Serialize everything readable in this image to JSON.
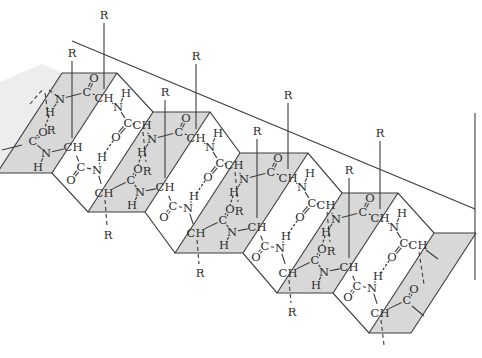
{
  "colors": {
    "background": "#ffffff",
    "ink": "#3c3c3c",
    "face_fill": "#d8d8d8",
    "label": "#2b2b2b"
  },
  "canvas": {
    "width": 482,
    "height": 358
  },
  "sheet": {
    "faces": [
      [
        [
          62,
          73
        ],
        [
          117,
          73
        ],
        [
          52,
          173
        ],
        [
          -3,
          173
        ]
      ],
      [
        [
          153,
          112
        ],
        [
          210,
          112
        ],
        [
          145,
          212
        ],
        [
          88,
          212
        ]
      ],
      [
        [
          240,
          153
        ],
        [
          308,
          153
        ],
        [
          243,
          253
        ],
        [
          175,
          253
        ]
      ],
      [
        [
          342,
          193
        ],
        [
          398,
          193
        ],
        [
          333,
          293
        ],
        [
          277,
          293
        ]
      ],
      [
        [
          434,
          233
        ],
        [
          476,
          233
        ],
        [
          411,
          333
        ],
        [
          369,
          333
        ]
      ]
    ],
    "faded_face": [
      [
        62,
        73
      ],
      [
        -3,
        173
      ],
      [
        -14,
        155
      ],
      [
        -14,
        88
      ],
      [
        42,
        64
      ]
    ],
    "top_zigzag": [
      [
        62,
        73
      ],
      [
        117,
        73
      ],
      [
        153,
        112
      ],
      [
        210,
        112
      ],
      [
        240,
        153
      ],
      [
        308,
        153
      ],
      [
        342,
        193
      ],
      [
        398,
        193
      ],
      [
        434,
        233
      ],
      [
        476,
        233
      ]
    ],
    "bottom_zigzag": [
      [
        -3,
        173
      ],
      [
        52,
        173
      ],
      [
        88,
        212
      ],
      [
        145,
        212
      ],
      [
        175,
        253
      ],
      [
        243,
        253
      ],
      [
        277,
        293
      ],
      [
        333,
        293
      ],
      [
        369,
        333
      ],
      [
        411,
        333
      ]
    ],
    "fold_lines": [
      [
        62,
        73,
        -3,
        173
      ],
      [
        117,
        73,
        52,
        173
      ],
      [
        153,
        112,
        88,
        212
      ],
      [
        210,
        112,
        145,
        212
      ],
      [
        240,
        153,
        175,
        253
      ],
      [
        308,
        153,
        243,
        253
      ],
      [
        342,
        193,
        277,
        293
      ],
      [
        398,
        193,
        333,
        293
      ],
      [
        434,
        233,
        369,
        333
      ],
      [
        476,
        233,
        411,
        333
      ]
    ],
    "long_lines": [
      [
        72,
        41,
        475,
        209
      ],
      [
        475,
        113,
        475,
        280
      ]
    ]
  },
  "atoms": [
    {
      "id": "bN0a",
      "t": "N",
      "x": 60,
      "y": 99
    },
    {
      "id": "bH0a",
      "t": "H",
      "x": 50,
      "y": 112
    },
    {
      "id": "bC0a",
      "t": "C",
      "x": 87,
      "y": 92
    },
    {
      "id": "bO0a",
      "t": "O",
      "x": 94,
      "y": 78
    },
    {
      "id": "bCH0a",
      "t": "CH",
      "x": 104,
      "y": 98
    },
    {
      "id": "bN0b",
      "t": "N",
      "x": 118,
      "y": 107
    },
    {
      "id": "bH0b",
      "t": "H",
      "x": 126,
      "y": 93
    },
    {
      "id": "bC0b",
      "t": "C",
      "x": 128,
      "y": 123
    },
    {
      "id": "bO0b",
      "t": "O",
      "x": 116,
      "y": 137
    },
    {
      "id": "bCH0b",
      "t": "CH",
      "x": 142,
      "y": 125
    },
    {
      "id": "bN1a",
      "t": "N",
      "x": 152,
      "y": 139
    },
    {
      "id": "bH1a",
      "t": "H",
      "x": 142,
      "y": 152
    },
    {
      "id": "bC1a",
      "t": "C",
      "x": 179,
      "y": 132
    },
    {
      "id": "bO1a",
      "t": "O",
      "x": 186,
      "y": 118
    },
    {
      "id": "bCH1a",
      "t": "CH",
      "x": 196,
      "y": 138
    },
    {
      "id": "bN1b",
      "t": "N",
      "x": 210,
      "y": 147
    },
    {
      "id": "bH1b",
      "t": "H",
      "x": 218,
      "y": 133
    },
    {
      "id": "bC1b",
      "t": "C",
      "x": 220,
      "y": 163
    },
    {
      "id": "bO1b",
      "t": "O",
      "x": 208,
      "y": 177
    },
    {
      "id": "bCH1b",
      "t": "CH",
      "x": 234,
      "y": 165
    },
    {
      "id": "bN2a",
      "t": "N",
      "x": 244,
      "y": 179
    },
    {
      "id": "bH2a",
      "t": "H",
      "x": 234,
      "y": 192
    },
    {
      "id": "bC2a",
      "t": "C",
      "x": 271,
      "y": 172
    },
    {
      "id": "bO2a",
      "t": "O",
      "x": 278,
      "y": 158
    },
    {
      "id": "bCH2a",
      "t": "CH",
      "x": 288,
      "y": 178
    },
    {
      "id": "bN2b",
      "t": "N",
      "x": 302,
      "y": 187
    },
    {
      "id": "bH2b",
      "t": "H",
      "x": 310,
      "y": 173
    },
    {
      "id": "bC2b",
      "t": "C",
      "x": 312,
      "y": 203
    },
    {
      "id": "bO2b",
      "t": "O",
      "x": 300,
      "y": 217
    },
    {
      "id": "bCH2b",
      "t": "CH",
      "x": 326,
      "y": 205
    },
    {
      "id": "bN3a",
      "t": "N",
      "x": 336,
      "y": 219
    },
    {
      "id": "bH3a",
      "t": "H",
      "x": 326,
      "y": 232
    },
    {
      "id": "bC3a",
      "t": "C",
      "x": 363,
      "y": 212
    },
    {
      "id": "bO3a",
      "t": "O",
      "x": 370,
      "y": 198
    },
    {
      "id": "bCH3a",
      "t": "CH",
      "x": 380,
      "y": 218
    },
    {
      "id": "bN3b",
      "t": "N",
      "x": 394,
      "y": 227
    },
    {
      "id": "bH3b",
      "t": "H",
      "x": 402,
      "y": 213
    },
    {
      "id": "bC3b",
      "t": "C",
      "x": 404,
      "y": 243
    },
    {
      "id": "bO3b",
      "t": "O",
      "x": 392,
      "y": 257
    },
    {
      "id": "bCH3b",
      "t": "CH",
      "x": 418,
      "y": 245
    },
    {
      "id": "fC0",
      "t": "C",
      "x": 33,
      "y": 141
    },
    {
      "id": "fO0",
      "t": "O",
      "x": 43,
      "y": 132
    },
    {
      "id": "fN0",
      "t": "N",
      "x": 46,
      "y": 153
    },
    {
      "id": "fH0",
      "t": "H",
      "x": 38,
      "y": 167
    },
    {
      "id": "fCH0",
      "t": "CH",
      "x": 73,
      "y": 147
    },
    {
      "id": "fC1",
      "t": "C",
      "x": 81,
      "y": 167
    },
    {
      "id": "fO1",
      "t": "O",
      "x": 71,
      "y": 180
    },
    {
      "id": "fN1",
      "t": "N",
      "x": 97,
      "y": 170
    },
    {
      "id": "fH1",
      "t": "H",
      "x": 102,
      "y": 157
    },
    {
      "id": "fCH1",
      "t": "CH",
      "x": 104,
      "y": 193
    },
    {
      "id": "fC2",
      "t": "C",
      "x": 131,
      "y": 180
    },
    {
      "id": "fO2",
      "t": "O",
      "x": 138,
      "y": 169
    },
    {
      "id": "fN2",
      "t": "N",
      "x": 140,
      "y": 192
    },
    {
      "id": "fH2",
      "t": "H",
      "x": 132,
      "y": 205
    },
    {
      "id": "fCH2",
      "t": "CH",
      "x": 165,
      "y": 187
    },
    {
      "id": "fC3",
      "t": "C",
      "x": 173,
      "y": 206
    },
    {
      "id": "fO3",
      "t": "O",
      "x": 164,
      "y": 217
    },
    {
      "id": "fN3",
      "t": "N",
      "x": 188,
      "y": 208
    },
    {
      "id": "fH3",
      "t": "H",
      "x": 194,
      "y": 196
    },
    {
      "id": "fCH3",
      "t": "CH",
      "x": 196,
      "y": 233
    },
    {
      "id": "fC4",
      "t": "C",
      "x": 223,
      "y": 220
    },
    {
      "id": "fO4",
      "t": "O",
      "x": 230,
      "y": 209
    },
    {
      "id": "fN4",
      "t": "N",
      "x": 232,
      "y": 232
    },
    {
      "id": "fH4",
      "t": "H",
      "x": 224,
      "y": 245
    },
    {
      "id": "fCH4",
      "t": "CH",
      "x": 257,
      "y": 227
    },
    {
      "id": "fC5",
      "t": "C",
      "x": 265,
      "y": 246
    },
    {
      "id": "fO5",
      "t": "O",
      "x": 256,
      "y": 257
    },
    {
      "id": "fN5",
      "t": "N",
      "x": 280,
      "y": 248
    },
    {
      "id": "fH5",
      "t": "H",
      "x": 286,
      "y": 236
    },
    {
      "id": "fCH5",
      "t": "CH",
      "x": 288,
      "y": 273
    },
    {
      "id": "fC6",
      "t": "C",
      "x": 315,
      "y": 260
    },
    {
      "id": "fO6",
      "t": "O",
      "x": 322,
      "y": 249
    },
    {
      "id": "fN6",
      "t": "N",
      "x": 324,
      "y": 272
    },
    {
      "id": "fH6",
      "t": "H",
      "x": 316,
      "y": 285
    },
    {
      "id": "fCH6",
      "t": "CH",
      "x": 349,
      "y": 267
    },
    {
      "id": "fC7",
      "t": "C",
      "x": 357,
      "y": 286
    },
    {
      "id": "fO7",
      "t": "O",
      "x": 348,
      "y": 297
    },
    {
      "id": "fN7",
      "t": "N",
      "x": 372,
      "y": 288
    },
    {
      "id": "fH7",
      "t": "H",
      "x": 378,
      "y": 276
    },
    {
      "id": "fCH7",
      "t": "CH",
      "x": 380,
      "y": 313
    },
    {
      "id": "fC8",
      "t": "C",
      "x": 407,
      "y": 300
    },
    {
      "id": "fO8",
      "t": "O",
      "x": 414,
      "y": 289
    },
    {
      "id": "lR",
      "t": "R",
      "x": 51,
      "y": 130
    }
  ],
  "bonds": [
    [
      "bN0a",
      "bC0a"
    ],
    [
      "bC0a",
      "bCH0a"
    ],
    [
      "bCH0a",
      "bN0b"
    ],
    [
      "bN0b",
      "bC0b"
    ],
    [
      "bC0b",
      "bCH0b"
    ],
    [
      "bCH0b",
      "bN1a"
    ],
    [
      "bN1a",
      "bC1a"
    ],
    [
      "bC1a",
      "bCH1a"
    ],
    [
      "bCH1a",
      "bN1b"
    ],
    [
      "bN1b",
      "bC1b"
    ],
    [
      "bC1b",
      "bCH1b"
    ],
    [
      "bCH1b",
      "bN2a"
    ],
    [
      "bN2a",
      "bC2a"
    ],
    [
      "bC2a",
      "bCH2a"
    ],
    [
      "bCH2a",
      "bN2b"
    ],
    [
      "bN2b",
      "bC2b"
    ],
    [
      "bC2b",
      "bCH2b"
    ],
    [
      "bCH2b",
      "bN3a"
    ],
    [
      "bN3a",
      "bC3a"
    ],
    [
      "bC3a",
      "bCH3a"
    ],
    [
      "bCH3a",
      "bN3b"
    ],
    [
      "bN3b",
      "bC3b"
    ],
    [
      "bC3b",
      "bCH3b"
    ],
    [
      "bN0a",
      "bH0a"
    ],
    [
      "bN0b",
      "bH0b"
    ],
    [
      "bN1a",
      "bH1a"
    ],
    [
      "bN1b",
      "bH1b"
    ],
    [
      "bN2a",
      "bH2a"
    ],
    [
      "bN2b",
      "bH2b"
    ],
    [
      "bN3a",
      "bH3a"
    ],
    [
      "bN3b",
      "bH3b"
    ],
    [
      "fC0",
      "fN0"
    ],
    [
      "fN0",
      "fCH0"
    ],
    [
      "fCH0",
      "fC1"
    ],
    [
      "fC1",
      "fN1"
    ],
    [
      "fN1",
      "fCH1"
    ],
    [
      "fCH1",
      "fC2"
    ],
    [
      "fC2",
      "fN2"
    ],
    [
      "fN2",
      "fCH2"
    ],
    [
      "fCH2",
      "fC3"
    ],
    [
      "fC3",
      "fN3"
    ],
    [
      "fN3",
      "fCH3"
    ],
    [
      "fCH3",
      "fC4"
    ],
    [
      "fC4",
      "fN4"
    ],
    [
      "fN4",
      "fCH4"
    ],
    [
      "fCH4",
      "fC5"
    ],
    [
      "fC5",
      "fN5"
    ],
    [
      "fN5",
      "fCH5"
    ],
    [
      "fCH5",
      "fC6"
    ],
    [
      "fC6",
      "fN6"
    ],
    [
      "fN6",
      "fCH6"
    ],
    [
      "fCH6",
      "fC7"
    ],
    [
      "fC7",
      "fN7"
    ],
    [
      "fN7",
      "fCH7"
    ],
    [
      "fCH7",
      "fC8"
    ],
    [
      "fN0",
      "fH0"
    ],
    [
      "fN1",
      "fH1"
    ],
    [
      "fN2",
      "fH2"
    ],
    [
      "fN3",
      "fH3"
    ],
    [
      "fN4",
      "fH4"
    ],
    [
      "fN5",
      "fH5"
    ],
    [
      "fN6",
      "fH6"
    ],
    [
      "fN7",
      "fH7"
    ]
  ],
  "double_bonds": [
    [
      "bC0a",
      "bO0a"
    ],
    [
      "bC0b",
      "bO0b"
    ],
    [
      "bC1a",
      "bO1a"
    ],
    [
      "bC1b",
      "bO1b"
    ],
    [
      "bC2a",
      "bO2a"
    ],
    [
      "bC2b",
      "bO2b"
    ],
    [
      "bC3a",
      "bO3a"
    ],
    [
      "bC3b",
      "bO3b"
    ],
    [
      "fC0",
      "fO0"
    ],
    [
      "fC1",
      "fO1"
    ],
    [
      "fC2",
      "fO2"
    ],
    [
      "fC3",
      "fO3"
    ],
    [
      "fC4",
      "fO4"
    ],
    [
      "fC5",
      "fO5"
    ],
    [
      "fC6",
      "fO6"
    ],
    [
      "fC7",
      "fO7"
    ],
    [
      "fC8",
      "fO8"
    ]
  ],
  "hydrogen_bonds": [
    [
      49,
      116,
      45,
      127
    ],
    [
      113,
      141,
      104,
      154
    ],
    [
      205,
      181,
      196,
      194
    ],
    [
      297,
      221,
      288,
      234
    ],
    [
      389,
      261,
      380,
      274
    ],
    [
      141,
      156,
      138,
      165
    ],
    [
      233,
      196,
      230,
      205
    ],
    [
      325,
      236,
      322,
      245
    ]
  ],
  "r_up": [
    {
      "label": "R",
      "x": 104,
      "ly": 15,
      "y2": 98
    },
    {
      "label": "R",
      "x": 196,
      "ly": 56,
      "y2": 138
    },
    {
      "label": "R",
      "x": 288,
      "ly": 95,
      "y2": 178
    },
    {
      "label": "R",
      "x": 380,
      "ly": 133,
      "y2": 218
    },
    {
      "label": "R",
      "x": 72,
      "ly": 53,
      "y2": 147
    },
    {
      "label": "R",
      "x": 165,
      "ly": 92,
      "y2": 187
    },
    {
      "label": "R",
      "x": 257,
      "ly": 131,
      "y2": 227
    },
    {
      "label": "R",
      "x": 349,
      "ly": 170,
      "y2": 267
    }
  ],
  "r_down": [
    {
      "label": "R",
      "x1": 143,
      "y1": 132,
      "x2": 146,
      "y2": 162,
      "lx": 147,
      "ly": 171
    },
    {
      "label": "R",
      "x1": 235,
      "y1": 172,
      "x2": 238,
      "y2": 202,
      "lx": 239,
      "ly": 211
    },
    {
      "label": "R",
      "x1": 327,
      "y1": 212,
      "x2": 330,
      "y2": 242,
      "lx": 331,
      "ly": 251
    },
    {
      "label": "",
      "x1": 419,
      "y1": 252,
      "x2": 424,
      "y2": 284
    },
    {
      "label": "R",
      "x1": 105,
      "y1": 200,
      "x2": 107,
      "y2": 226,
      "lx": 108,
      "ly": 235
    },
    {
      "label": "R",
      "x1": 197,
      "y1": 240,
      "x2": 199,
      "y2": 264,
      "lx": 200,
      "ly": 273
    },
    {
      "label": "R",
      "x1": 289,
      "y1": 280,
      "x2": 291,
      "y2": 303,
      "lx": 292,
      "ly": 312
    },
    {
      "label": "",
      "x1": 381,
      "y1": 320,
      "x2": 384,
      "y2": 345
    }
  ],
  "extra_solid": [
    [
      2,
      150,
      22,
      145
    ],
    [
      426,
      250,
      438,
      259
    ],
    [
      412,
      306,
      424,
      316
    ]
  ],
  "extra_dashed": [
    [
      30,
      104,
      44,
      88
    ],
    [
      49,
      90,
      57,
      96
    ],
    [
      45,
      93,
      49,
      121
    ]
  ]
}
